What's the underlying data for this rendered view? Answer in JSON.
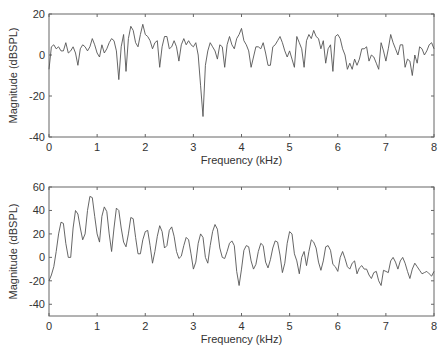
{
  "figure": {
    "background": "#ffffff",
    "line_color": "#555555",
    "axis_color": "#666666",
    "text_color": "#333333"
  },
  "chart_data": [
    {
      "type": "line",
      "title": "",
      "xlabel": "Frequency (kHz)",
      "ylabel": "Magnitude (dBSPL)",
      "xlim": [
        0,
        8
      ],
      "ylim": [
        -40,
        20
      ],
      "xticks": [
        0,
        1,
        2,
        3,
        4,
        5,
        6,
        7,
        8
      ],
      "yticks": [
        -40,
        -20,
        0,
        20
      ],
      "grid": false,
      "legend": null,
      "plot_box_px": {
        "left": 49,
        "top": 14,
        "right": 434,
        "bottom": 137
      },
      "series": [
        {
          "name": "spectrum-1",
          "x": [
            0.0,
            0.05,
            0.1,
            0.15,
            0.2,
            0.25,
            0.3,
            0.35,
            0.4,
            0.45,
            0.5,
            0.55,
            0.6,
            0.65,
            0.7,
            0.75,
            0.8,
            0.85,
            0.9,
            0.95,
            1.0,
            1.05,
            1.1,
            1.15,
            1.2,
            1.25,
            1.3,
            1.35,
            1.4,
            1.45,
            1.5,
            1.55,
            1.6,
            1.65,
            1.7,
            1.75,
            1.8,
            1.85,
            1.9,
            1.95,
            2.0,
            2.05,
            2.1,
            2.15,
            2.2,
            2.25,
            2.3,
            2.35,
            2.4,
            2.45,
            2.5,
            2.55,
            2.6,
            2.65,
            2.7,
            2.75,
            2.8,
            2.85,
            2.9,
            2.95,
            3.0,
            3.05,
            3.1,
            3.15,
            3.2,
            3.25,
            3.3,
            3.35,
            3.4,
            3.45,
            3.5,
            3.55,
            3.6,
            3.65,
            3.7,
            3.75,
            3.8,
            3.85,
            3.9,
            3.95,
            4.0,
            4.05,
            4.1,
            4.15,
            4.2,
            4.25,
            4.3,
            4.35,
            4.4,
            4.45,
            4.5,
            4.55,
            4.6,
            4.65,
            4.7,
            4.75,
            4.8,
            4.85,
            4.9,
            4.95,
            5.0,
            5.05,
            5.1,
            5.15,
            5.2,
            5.25,
            5.3,
            5.35,
            5.4,
            5.45,
            5.5,
            5.55,
            5.6,
            5.65,
            5.7,
            5.75,
            5.8,
            5.85,
            5.9,
            5.95,
            6.0,
            6.05,
            6.1,
            6.15,
            6.2,
            6.25,
            6.3,
            6.35,
            6.4,
            6.45,
            6.5,
            6.55,
            6.6,
            6.65,
            6.7,
            6.75,
            6.8,
            6.85,
            6.9,
            6.95,
            7.0,
            7.05,
            7.1,
            7.15,
            7.2,
            7.25,
            7.3,
            7.35,
            7.4,
            7.45,
            7.5,
            7.55,
            7.6,
            7.65,
            7.7,
            7.75,
            7.8,
            7.85,
            7.9,
            7.95,
            8.0
          ],
          "y": [
            -7,
            4,
            5,
            3,
            4,
            2,
            2,
            6,
            1,
            2,
            4,
            1,
            -5,
            3,
            5,
            4,
            2,
            4,
            8,
            5,
            1,
            -1,
            5,
            1,
            3,
            6,
            8,
            7,
            2,
            -12,
            4,
            10,
            -8,
            8,
            14,
            12,
            6,
            4,
            10,
            15,
            10,
            9,
            7,
            3,
            6,
            7,
            -6,
            4,
            9,
            9,
            3,
            4,
            7,
            4,
            -3,
            5,
            8,
            5,
            7,
            5,
            4,
            6,
            0,
            -15,
            -30,
            -5,
            2,
            6,
            4,
            2,
            -2,
            5,
            4,
            -6,
            5,
            9,
            5,
            3,
            8,
            10,
            13,
            7,
            5,
            2,
            -6,
            -1,
            4,
            4,
            3,
            6,
            1,
            -5,
            -5,
            4,
            5,
            7,
            9,
            6,
            2,
            -1,
            2,
            -2,
            -6,
            9,
            6,
            3,
            -6,
            7,
            10,
            8,
            12,
            9,
            8,
            3,
            7,
            -4,
            3,
            5,
            -8,
            9,
            10,
            8,
            3,
            0,
            -7,
            -4,
            -7,
            -2,
            -5,
            -2,
            3,
            3,
            4,
            -3,
            0,
            -1,
            -4,
            -7,
            6,
            2,
            -3,
            3,
            10,
            6,
            3,
            0,
            5,
            5,
            -6,
            -2,
            -3,
            -10,
            0,
            -4,
            4,
            3,
            0,
            2,
            5,
            6,
            3,
            4,
            -12,
            3,
            2,
            0,
            2,
            -3,
            1,
            0,
            3,
            -2,
            0,
            0,
            -1
          ]
        }
      ]
    },
    {
      "type": "line",
      "title": "",
      "xlabel": "Frequency (kHz)",
      "ylabel": "Magnitude (dBSPL)",
      "xlim": [
        0,
        8
      ],
      "ylim": [
        -50,
        60
      ],
      "xticks": [
        0,
        1,
        2,
        3,
        4,
        5,
        6,
        7,
        8
      ],
      "yticks": [
        -40,
        -20,
        0,
        20,
        40,
        60
      ],
      "grid": false,
      "legend": null,
      "plot_box_px": {
        "left": 49,
        "top": 187,
        "right": 434,
        "bottom": 316
      },
      "series": [
        {
          "name": "spectrum-2",
          "x": [
            0.0,
            0.05,
            0.1,
            0.15,
            0.2,
            0.25,
            0.3,
            0.35,
            0.4,
            0.45,
            0.5,
            0.55,
            0.6,
            0.65,
            0.7,
            0.75,
            0.8,
            0.85,
            0.9,
            0.95,
            1.0,
            1.05,
            1.1,
            1.15,
            1.2,
            1.25,
            1.3,
            1.35,
            1.4,
            1.45,
            1.5,
            1.55,
            1.6,
            1.65,
            1.7,
            1.75,
            1.8,
            1.85,
            1.9,
            1.95,
            2.0,
            2.05,
            2.1,
            2.15,
            2.2,
            2.25,
            2.3,
            2.35,
            2.4,
            2.45,
            2.5,
            2.55,
            2.6,
            2.65,
            2.7,
            2.75,
            2.8,
            2.85,
            2.9,
            2.95,
            3.0,
            3.05,
            3.1,
            3.15,
            3.2,
            3.25,
            3.3,
            3.35,
            3.4,
            3.45,
            3.5,
            3.55,
            3.6,
            3.65,
            3.7,
            3.75,
            3.8,
            3.85,
            3.9,
            3.95,
            4.0,
            4.05,
            4.1,
            4.15,
            4.2,
            4.25,
            4.3,
            4.35,
            4.4,
            4.45,
            4.5,
            4.55,
            4.6,
            4.65,
            4.7,
            4.75,
            4.8,
            4.85,
            4.9,
            4.95,
            5.0,
            5.05,
            5.1,
            5.15,
            5.2,
            5.25,
            5.3,
            5.35,
            5.4,
            5.45,
            5.5,
            5.55,
            5.6,
            5.65,
            5.7,
            5.75,
            5.8,
            5.85,
            5.9,
            5.95,
            6.0,
            6.05,
            6.1,
            6.15,
            6.2,
            6.25,
            6.3,
            6.35,
            6.4,
            6.45,
            6.5,
            6.55,
            6.6,
            6.65,
            6.7,
            6.75,
            6.8,
            6.85,
            6.9,
            6.95,
            7.0,
            7.05,
            7.1,
            7.15,
            7.2,
            7.25,
            7.3,
            7.35,
            7.4,
            7.45,
            7.5,
            7.55,
            7.6,
            7.65,
            7.7,
            7.75,
            7.8,
            7.85,
            7.9,
            7.95,
            8.0
          ],
          "y": [
            -20,
            -15,
            -8,
            5,
            20,
            30,
            29,
            12,
            0,
            0,
            25,
            40,
            37,
            25,
            15,
            20,
            40,
            52,
            51,
            35,
            20,
            13,
            35,
            43,
            39,
            20,
            5,
            25,
            42,
            40,
            25,
            13,
            9,
            20,
            34,
            33,
            17,
            3,
            3,
            15,
            22,
            23,
            10,
            -5,
            5,
            18,
            27,
            22,
            8,
            10,
            23,
            26,
            18,
            5,
            -1,
            1,
            10,
            17,
            15,
            3,
            -10,
            -4,
            12,
            20,
            17,
            0,
            -5,
            10,
            22,
            28,
            24,
            8,
            0,
            -1,
            5,
            12,
            14,
            10,
            -12,
            -24,
            -10,
            6,
            10,
            9,
            -3,
            -10,
            -6,
            5,
            12,
            10,
            -4,
            -9,
            -2,
            8,
            14,
            13,
            2,
            -13,
            -5,
            12,
            22,
            20,
            3,
            -3,
            -14,
            0,
            5,
            -7,
            5,
            15,
            13,
            8,
            -4,
            -11,
            -3,
            9,
            10,
            6,
            -6,
            -8,
            -12,
            0,
            5,
            -1,
            -8,
            -10,
            -5,
            -3,
            -14,
            -9,
            -7,
            -10,
            -10,
            -15,
            -18,
            -13,
            -12,
            -20,
            -24,
            -11,
            -12,
            -13,
            -3,
            0,
            -4,
            -10,
            -3,
            0,
            -5,
            -12,
            -18,
            -10,
            -5,
            -8,
            -11,
            -14,
            -13,
            -12,
            -14,
            -16,
            -12,
            -16,
            -20,
            -22,
            -18,
            -16
          ]
        }
      ]
    }
  ]
}
